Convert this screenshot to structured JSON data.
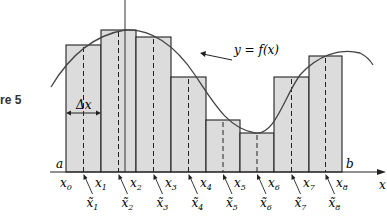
{
  "figure": {
    "caption": "re 5",
    "function_label": "y = f(x)",
    "delta_label": "Δx",
    "endpoint_a": "a",
    "endpoint_b": "b",
    "x_axis_label": "x",
    "y_axis_label": "y",
    "partition_labels": [
      "x0",
      "x1",
      "x2",
      "x3",
      "x4",
      "x5",
      "x6",
      "x7",
      "x8"
    ],
    "sample_labels": [
      "x̃1",
      "x̃2",
      "x̃3",
      "x̃4",
      "x̃5",
      "x̃6",
      "x̃7",
      "x̃8"
    ],
    "colors": {
      "fill": "#dcdcdc",
      "stroke": "#222222",
      "curve": "#444444"
    },
    "partition_x": [
      66,
      101,
      136,
      171,
      206,
      240,
      274,
      309,
      342
    ],
    "rect_tops": [
      45,
      30,
      37,
      77,
      120,
      133,
      77,
      56
    ],
    "baseline_y": 172
  }
}
